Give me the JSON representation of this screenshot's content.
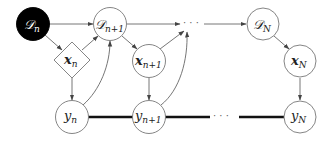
{
  "diagram": {
    "type": "probabilistic-graphical-model",
    "nodes": [
      {
        "id": "D_n",
        "label": "D",
        "sub": "n",
        "shape": "circle",
        "filled": true,
        "x": 33,
        "y": 24
      },
      {
        "id": "D_n1",
        "label": "D",
        "sub": "n+1",
        "shape": "circle",
        "filled": false,
        "x": 110,
        "y": 24
      },
      {
        "id": "dots_top",
        "label": "···",
        "shape": "text",
        "x": 193,
        "y": 24
      },
      {
        "id": "D_N",
        "label": "D",
        "sub": "N",
        "shape": "circle",
        "filled": false,
        "x": 263,
        "y": 24
      },
      {
        "id": "x_n",
        "label": "x",
        "sub": "n",
        "shape": "diamond",
        "filled": false,
        "x": 72,
        "y": 60
      },
      {
        "id": "x_n1",
        "label": "x",
        "sub": "n+1",
        "shape": "circle",
        "filled": false,
        "x": 149,
        "y": 61
      },
      {
        "id": "x_N",
        "label": "x",
        "sub": "N",
        "shape": "circle",
        "filled": false,
        "x": 300,
        "y": 61
      },
      {
        "id": "y_n",
        "label": "y",
        "sub": "n",
        "shape": "circle",
        "filled": false,
        "x": 72,
        "y": 117
      },
      {
        "id": "y_n1",
        "label": "y",
        "sub": "n+1",
        "shape": "circle",
        "filled": false,
        "x": 149,
        "y": 117
      },
      {
        "id": "dots_bottom",
        "label": "···",
        "shape": "text",
        "x": 225,
        "y": 117
      },
      {
        "id": "y_N",
        "label": "y",
        "sub": "N",
        "shape": "circle",
        "filled": false,
        "x": 300,
        "y": 117
      }
    ],
    "edges": [
      {
        "from": "D_n",
        "to": "D_n1",
        "style": "arrow"
      },
      {
        "from": "D_n",
        "to": "x_n",
        "style": "arrow"
      },
      {
        "from": "x_n",
        "to": "D_n1",
        "style": "arrow"
      },
      {
        "from": "x_n",
        "to": "y_n",
        "style": "arrow"
      },
      {
        "from": "y_n",
        "to": "D_n1",
        "style": "curved-arrow"
      },
      {
        "from": "D_n1",
        "to": "dots_top",
        "style": "arrow"
      },
      {
        "from": "D_n1",
        "to": "x_n1",
        "style": "arrow"
      },
      {
        "from": "x_n1",
        "to": "dots_top",
        "style": "arrow"
      },
      {
        "from": "x_n1",
        "to": "y_n1",
        "style": "arrow"
      },
      {
        "from": "y_n1",
        "to": "dots_top",
        "style": "curved-arrow"
      },
      {
        "from": "dots_top",
        "to": "D_N",
        "style": "arrow"
      },
      {
        "from": "D_N",
        "to": "x_N",
        "style": "arrow"
      },
      {
        "from": "x_N",
        "to": "y_N",
        "style": "arrow"
      },
      {
        "from": "y_n",
        "to": "y_n1",
        "style": "thick-undirected"
      },
      {
        "from": "y_n1",
        "to": "dots_bottom",
        "style": "thick-undirected"
      },
      {
        "from": "dots_bottom",
        "to": "y_N",
        "style": "thick-undirected"
      }
    ],
    "labels": {
      "D_n": {
        "main": "𝒟",
        "sub": "n"
      },
      "D_n1": {
        "main": "𝒟",
        "sub": "n+1"
      },
      "D_N": {
        "main": "𝒟",
        "sub": "N"
      },
      "x_n": {
        "main": "x",
        "sub": "n"
      },
      "x_n1": {
        "main": "x",
        "sub": "n+1"
      },
      "x_N": {
        "main": "x",
        "sub": "N"
      },
      "y_n": {
        "main": "y",
        "sub": "n"
      },
      "y_n1": {
        "main": "y",
        "sub": "n+1"
      },
      "y_N": {
        "main": "y",
        "sub": "N"
      },
      "dots": "· · ·"
    },
    "colors": {
      "stroke": "#555555",
      "filled_node": "#000000",
      "thick_edge": "#111111",
      "background": "#ffffff"
    }
  }
}
